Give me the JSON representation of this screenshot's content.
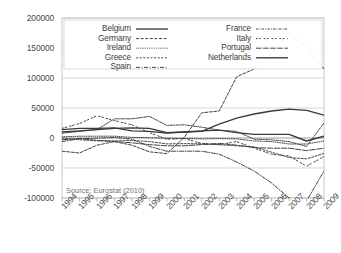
{
  "source_note": "Source: Eurostat (2010)",
  "legend": {
    "entries": [
      {
        "label": "Belgium",
        "style": "solid",
        "column": "left"
      },
      {
        "label": "Germany",
        "style": "dashed",
        "column": "left"
      },
      {
        "label": "Ireland",
        "style": "dotted",
        "column": "left"
      },
      {
        "label": "Greece",
        "style": "dash-short",
        "column": "left"
      },
      {
        "label": "Spain",
        "style": "dash-dot",
        "column": "left"
      },
      {
        "label": "France",
        "style": "dash-dot-fine",
        "column": "right"
      },
      {
        "label": "Italy",
        "style": "dash-space",
        "column": "right"
      },
      {
        "label": "Portugal",
        "style": "dash-long",
        "column": "right"
      },
      {
        "label": "Netherlands",
        "style": "solid",
        "column": "right"
      }
    ]
  },
  "chart_data": {
    "type": "line",
    "title": "",
    "xlabel": "",
    "ylabel": "",
    "grid": true,
    "legend_position": "top-inside",
    "xlim": [
      1994,
      2009
    ],
    "ylim": [
      -100000,
      200000
    ],
    "ytick_labels": [
      "200000",
      "150000",
      "100000",
      "50000",
      "0",
      "-50000",
      "-100000"
    ],
    "yticks": [
      200000,
      150000,
      100000,
      50000,
      0,
      -50000,
      -100000
    ],
    "x": [
      1994,
      1995,
      1996,
      1997,
      1998,
      1999,
      2000,
      2001,
      2002,
      2003,
      2004,
      2005,
      2006,
      2007,
      2008,
      2009
    ],
    "categories": [
      "1994",
      "1995",
      "1996",
      "1997",
      "1998",
      "1999",
      "2000",
      "2001",
      "2002",
      "2003",
      "2004",
      "2005",
      "2006",
      "2007",
      "2008",
      "2009"
    ],
    "series": [
      {
        "name": "Belgium",
        "style": "solid",
        "values": [
          10000,
          12000,
          14000,
          16000,
          17000,
          16000,
          9000,
          10000,
          12000,
          13000,
          9000,
          6000,
          6000,
          6000,
          -5000,
          3000
        ]
      },
      {
        "name": "Germany",
        "style": "dashed",
        "values": [
          -22000,
          -25000,
          -12000,
          -6000,
          -12000,
          -23000,
          -26000,
          1000,
          42000,
          45000,
          102000,
          115000,
          140000,
          175000,
          153000,
          115000
        ]
      },
      {
        "name": "Ireland",
        "style": "dotted",
        "values": [
          2000,
          3000,
          3000,
          3000,
          1000,
          500,
          -500,
          -700,
          -1500,
          -1000,
          -1500,
          -5000,
          -6000,
          -10000,
          -10000,
          -5000
        ]
      },
      {
        "name": "Greece",
        "style": "dash-short",
        "values": [
          -150,
          -2900,
          -4700,
          -4800,
          -4000,
          -6000,
          -9800,
          -9400,
          -9700,
          -11200,
          -13000,
          -14700,
          -23700,
          -32600,
          -34800,
          -25800
        ]
      },
      {
        "name": "Spain",
        "style": "dash-dot",
        "values": [
          -6000,
          -1000,
          -400,
          1000,
          -2000,
          -14000,
          -22000,
          -22000,
          -22000,
          -27000,
          -40000,
          -55000,
          -75000,
          -100000,
          -105000,
          -55000
        ]
      },
      {
        "name": "France",
        "style": "dash-dot-fine",
        "values": [
          8000,
          11000,
          14000,
          32000,
          32000,
          36000,
          21000,
          22000,
          18000,
          13000,
          11000,
          -2000,
          -3000,
          -6000,
          -14000,
          25000
        ]
      },
      {
        "name": "Italy",
        "style": "dash-space",
        "values": [
          16000,
          24000,
          37000,
          29000,
          22000,
          9000,
          -2000,
          -1000,
          -9000,
          -11000,
          -6000,
          -17000,
          -27000,
          -30000,
          -47000,
          -31000
        ]
      },
      {
        "name": "Portugal",
        "style": "dash-long",
        "values": [
          -3000,
          -1000,
          -4000,
          -6000,
          -8000,
          -11000,
          -13000,
          -13000,
          -11000,
          -9000,
          -12000,
          -16000,
          -17000,
          -17000,
          -21000,
          -17000
        ]
      },
      {
        "name": "Netherlands",
        "style": "solid",
        "values": [
          14000,
          16000,
          16000,
          17000,
          12000,
          11000,
          8000,
          10000,
          11000,
          23000,
          33000,
          40000,
          45000,
          48000,
          46000,
          38000
        ]
      }
    ]
  }
}
